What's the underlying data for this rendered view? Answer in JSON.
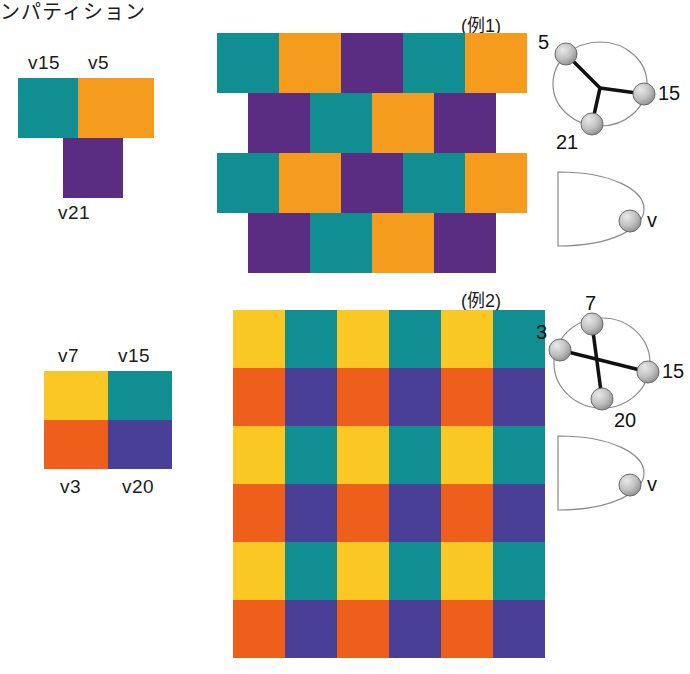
{
  "page": {
    "title_text": "ンパティション",
    "background": "#ffffff"
  },
  "palette": {
    "teal": "#108e92",
    "orange": "#f59c1f",
    "purple": "#5a2d82",
    "yellow": "#f9c825",
    "red_orange": "#ef5f1c",
    "blue_purple": "#4a3f96",
    "node_fill": "#b9b9b9",
    "node_stroke": "#6b6b6b",
    "edge": "#111111",
    "circle_stroke": "#8a8a8a"
  },
  "example1": {
    "caption": "(例1)",
    "tile_labels": {
      "top_left": "v15",
      "top_right": "v5",
      "bottom": "v21"
    },
    "tile_colors": {
      "top_left": "teal",
      "top_right": "orange",
      "bottom": "purple"
    },
    "pattern": {
      "rows": [
        {
          "offset": 0,
          "cells": [
            "teal",
            "orange",
            "purple",
            "teal",
            "orange"
          ]
        },
        {
          "offset": 0.5,
          "cells": [
            "purple",
            "teal",
            "orange",
            "purple"
          ]
        },
        {
          "offset": 0,
          "cells": [
            "teal",
            "orange",
            "purple",
            "teal",
            "orange"
          ]
        },
        {
          "offset": 0.5,
          "cells": [
            "purple",
            "teal",
            "orange",
            "purple"
          ]
        }
      ]
    },
    "graph": {
      "nodes": [
        "5",
        "15",
        "21"
      ],
      "loop_node": "v"
    }
  },
  "example2": {
    "caption": "(例2)",
    "tile_labels": {
      "top_left": "v7",
      "top_right": "v15",
      "bottom_left": "v3",
      "bottom_right": "v20"
    },
    "tile_colors": {
      "top_left": "yellow",
      "top_right": "teal",
      "bottom_left": "red_orange",
      "bottom_right": "blue_purple"
    },
    "pattern": {
      "grid": [
        [
          "yellow",
          "teal",
          "yellow",
          "teal",
          "yellow",
          "teal"
        ],
        [
          "red_orange",
          "blue_purple",
          "red_orange",
          "blue_purple",
          "red_orange",
          "blue_purple"
        ],
        [
          "yellow",
          "teal",
          "yellow",
          "teal",
          "yellow",
          "teal"
        ],
        [
          "red_orange",
          "blue_purple",
          "red_orange",
          "blue_purple",
          "red_orange",
          "blue_purple"
        ],
        [
          "yellow",
          "teal",
          "yellow",
          "teal",
          "yellow",
          "teal"
        ],
        [
          "red_orange",
          "blue_purple",
          "red_orange",
          "blue_purple",
          "red_orange",
          "blue_purple"
        ]
      ]
    },
    "graph": {
      "nodes": [
        "7",
        "3",
        "15",
        "20"
      ],
      "loop_node": "v"
    }
  }
}
